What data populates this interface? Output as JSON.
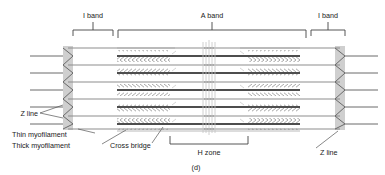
{
  "figure": {
    "panel_label": "(d)",
    "colors": {
      "thick_filament": "#555555",
      "thin_filament": "#8c8c8c",
      "z_line_band": "#cccccc",
      "bracket": "#444444",
      "text": "#1a1a1a",
      "background": "#ffffff",
      "m_line": "#bbbbbb"
    }
  },
  "labels": {
    "i_band_left": "I band",
    "a_band": "A band",
    "i_band_right": "I band",
    "z_line_left": "Z line",
    "z_line_right": "Z line",
    "thin_myofilament": "Thin myofilament",
    "thick_myofilament": "Thick myofilament",
    "cross_bridge": "Cross bridge",
    "h_zone": "H zone",
    "panel": "(d)"
  },
  "brackets": [
    {
      "name": "i-band-left",
      "label": "I band",
      "x1": 72,
      "x2": 115,
      "y": 30,
      "orient": "down"
    },
    {
      "name": "a-band",
      "label": "A band",
      "x1": 117,
      "x2": 307,
      "y": 30,
      "orient": "down"
    },
    {
      "name": "i-band-right",
      "label": "I band",
      "x1": 309,
      "x2": 345,
      "y": 30,
      "orient": "down"
    },
    {
      "name": "h-zone",
      "label": "H zone",
      "x1": 170,
      "x2": 248,
      "y": 136,
      "orient": "up"
    }
  ],
  "structure": {
    "sarcomere_left": 68,
    "sarcomere_right": 348,
    "z_line_left_x": 68,
    "z_line_right_x": 340,
    "z_band_width": 10,
    "rows": 5,
    "row_top": 52,
    "row_spacing": 17,
    "thick_start": 117,
    "thick_end": 300,
    "h_zone_start": 170,
    "h_zone_end": 248,
    "m_line_center": 209,
    "thin_overlap_left": 114,
    "thin_overlap_right": 303
  }
}
